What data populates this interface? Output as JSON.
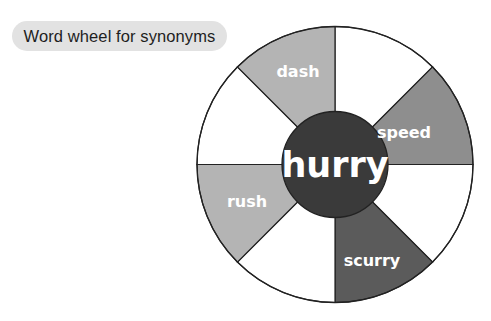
{
  "title": "Word wheel for synonyms",
  "wheel": {
    "center_word": "hurry",
    "segments": [
      {
        "label": "",
        "color": "#ffffff"
      },
      {
        "label": "speed",
        "color": "#8e8e8e"
      },
      {
        "label": "",
        "color": "#ffffff"
      },
      {
        "label": "scurry",
        "color": "#5b5b5b"
      },
      {
        "label": "",
        "color": "#ffffff"
      },
      {
        "label": "rush",
        "color": "#b4b4b4"
      },
      {
        "label": "",
        "color": "#ffffff"
      },
      {
        "label": "dash",
        "color": "#b4b4b4"
      }
    ],
    "center_color": "#3a3a3a",
    "stroke_color": "#222222"
  }
}
